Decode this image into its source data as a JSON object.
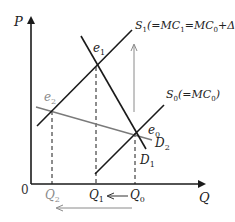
{
  "diagram": {
    "type": "supply-demand",
    "axes": {
      "y_label": "P",
      "x_label": "Q",
      "origin_label": "0"
    },
    "curves": {
      "S1": {
        "name": "S",
        "sub": "1",
        "annotation": "(=MC",
        "ann_sub1": "1",
        "ann_eq": "=MC",
        "ann_sub2": "0",
        "ann_tail": "+ΔW)"
      },
      "S0": {
        "name": "S",
        "sub": "0",
        "annotation": "(=MC",
        "ann_sub": "0",
        "ann_tail": ")"
      },
      "D1": {
        "name": "D",
        "sub": "1"
      },
      "D2": {
        "name": "D",
        "sub": "2"
      }
    },
    "equilibria": {
      "e0": {
        "name": "e",
        "sub": "0"
      },
      "e1": {
        "name": "e",
        "sub": "1"
      },
      "e2": {
        "name": "e",
        "sub": "2"
      }
    },
    "quantities": {
      "Q0": {
        "name": "Q",
        "sub": "0"
      },
      "Q1": {
        "name": "Q",
        "sub": "1"
      },
      "Q2": {
        "name": "Q",
        "sub": "2"
      }
    },
    "colors": {
      "line": "#1a1a1a",
      "gray": "#8a8a8a"
    }
  }
}
